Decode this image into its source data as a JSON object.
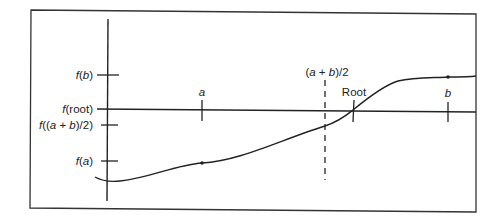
{
  "diagram": {
    "type": "bisection-method-illustration",
    "colors": {
      "line": "#222222",
      "background": "#ffffff",
      "frame": "#333333"
    },
    "y_axis_labels": [
      {
        "id": "fb",
        "func": "f",
        "arg": "b",
        "y": 75
      },
      {
        "id": "froot",
        "func": "f",
        "arg": "root",
        "y": 109
      },
      {
        "id": "fmid",
        "func": "f",
        "arg": "(a + b)/2",
        "y": 125
      },
      {
        "id": "fa",
        "func": "f",
        "arg": "a",
        "y": 161
      }
    ],
    "x_axis_labels": {
      "a": "a",
      "b": "b",
      "root": "Root",
      "midpoint": "(a + b)/2"
    },
    "labels_text": {
      "fb": "f(b)",
      "froot": "f(root)",
      "fmid": "f((a + b)/2)",
      "fa": "f(a)",
      "a": "a",
      "b": "b",
      "root": "Root",
      "midpoint": "(a + b)/2"
    },
    "points": {
      "a": {
        "x": 202,
        "y": 163
      },
      "b": {
        "x": 448,
        "y": 77
      },
      "root": {
        "x": 353,
        "y": 109
      },
      "midpoint_x": 325
    }
  }
}
